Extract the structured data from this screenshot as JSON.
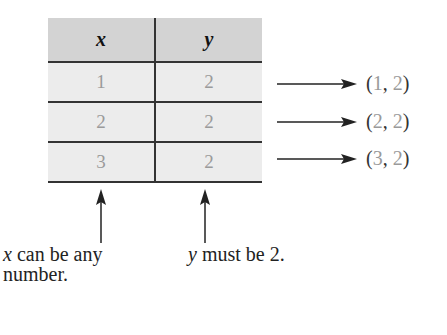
{
  "table": {
    "headers": [
      "x",
      "y"
    ],
    "rows": [
      {
        "x": "1",
        "y": "2"
      },
      {
        "x": "2",
        "y": "2"
      },
      {
        "x": "3",
        "y": "2"
      }
    ]
  },
  "pairs": [
    {
      "open": "(",
      "x": "1",
      "sep": ", ",
      "y": "2",
      "close": ")"
    },
    {
      "open": "(",
      "x": "2",
      "sep": ", ",
      "y": "2",
      "close": ")"
    },
    {
      "open": "(",
      "x": "3",
      "sep": ", ",
      "y": "2",
      "close": ")"
    }
  ],
  "captions": {
    "x_var": "x",
    "x_text_line1": " can be any",
    "x_text_line2": "number.",
    "y_var": "y",
    "y_text": " must be 2."
  },
  "colors": {
    "header_bg": "#d3d3d3",
    "row_bg": "#ececec",
    "value_gray": "#9a9a9a",
    "line": "#333333"
  }
}
